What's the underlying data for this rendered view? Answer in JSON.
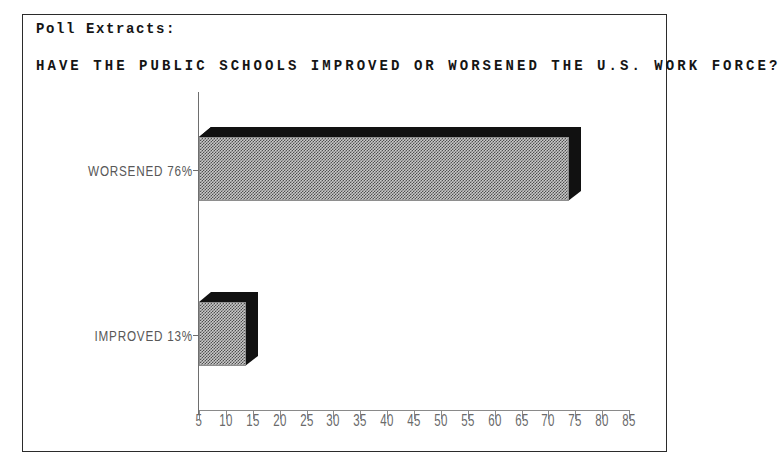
{
  "header": {
    "section_label": "Poll Extracts:"
  },
  "chart_data": {
    "type": "bar",
    "orientation": "horizontal",
    "title": "HAVE THE PUBLIC SCHOOLS IMPROVED OR WORSENED THE U.S. WORK FORCE?",
    "categories": [
      "WORSENED",
      "IMPROVED"
    ],
    "values": [
      76,
      13
    ],
    "value_labels": [
      "76%",
      "13%"
    ],
    "category_labels": [
      "WORSENED 76%",
      "IMPROVED 13%"
    ],
    "xlabel": "",
    "ylabel": "",
    "xlim": [
      5,
      85
    ],
    "xticks": [
      5,
      10,
      15,
      20,
      25,
      30,
      35,
      40,
      45,
      50,
      55,
      60,
      65,
      70,
      75,
      80,
      85
    ],
    "xtick_labels": [
      "5",
      "10",
      "15",
      "20",
      "25",
      "30",
      "35",
      "40",
      "45",
      "50",
      "55",
      "60",
      "65",
      "70",
      "75",
      "80",
      "85"
    ],
    "grid": false,
    "legend": false,
    "style": "3d-shaded-hatch",
    "colors": {
      "bar_face": "#c9c9c9",
      "bar_hatch": "#4f4f4f",
      "bar_shadow": "#111111",
      "axis": "#8a8a8a",
      "text": "#6a6a6a",
      "title": "#151515",
      "frame": "#2b2b2b",
      "background": "#ffffff"
    }
  }
}
